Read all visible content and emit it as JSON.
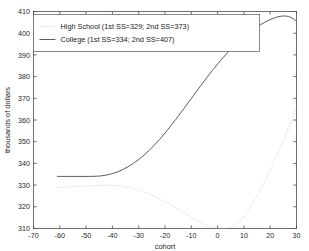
{
  "chart_data": {
    "type": "line",
    "title": "",
    "xlabel": "cohort",
    "ylabel": "thousands of dollars",
    "xlim": [
      -70,
      30
    ],
    "ylim": [
      310,
      410
    ],
    "xticks": [
      -70,
      -60,
      -50,
      -40,
      -30,
      -20,
      -10,
      0,
      10,
      20,
      30
    ],
    "xticklabels": [
      "-70",
      "-60",
      "-50",
      "-40",
      "-30",
      "-20",
      "-10",
      "0",
      "10",
      "20",
      "30"
    ],
    "yticks": [
      310,
      320,
      330,
      340,
      350,
      360,
      370,
      380,
      390,
      400,
      410
    ],
    "yticklabels": [
      "310",
      "320",
      "330",
      "340",
      "350",
      "360",
      "370",
      "380",
      "390",
      "400",
      "410"
    ],
    "grid": false,
    "legend_position": "upper-left",
    "legend_entries": [
      "High School (1st SS=329; 2nd SS=373)",
      "College (1st SS=334; 2nd SS=407)"
    ],
    "series": [
      {
        "name": "High School (1st SS=329; 2nd SS=373)",
        "style": "dotted",
        "color": "#c9c9c9",
        "x": [
          -61,
          -58,
          -55,
          -52,
          -49,
          -46,
          -43,
          -41,
          -39,
          -36,
          -33,
          -30,
          -27,
          -24,
          -21,
          -18,
          -15,
          -12,
          -9,
          -6,
          -3,
          0,
          2,
          3,
          5,
          7,
          9,
          11,
          13,
          15,
          17,
          19,
          21,
          23,
          25,
          27,
          29,
          30
        ],
        "y": [
          328.9,
          329.1,
          329.3,
          329.5,
          329.6,
          329.8,
          329.9,
          329.9,
          329.8,
          329.4,
          328.7,
          327.7,
          326.4,
          324.8,
          323.0,
          321.0,
          318.9,
          316.7,
          314.5,
          312.5,
          310.9,
          310.1,
          310.0,
          310.0,
          310.6,
          312.0,
          314.2,
          317.2,
          320.8,
          324.9,
          329.5,
          334.4,
          339.6,
          345.0,
          350.6,
          356.4,
          362.4,
          365.5
        ]
      },
      {
        "name": "College (1st SS=334; 2nd SS=407)",
        "style": "solid",
        "color": "#4a4a4a",
        "x": [
          -61,
          -57,
          -53,
          -49,
          -46,
          -44,
          -42,
          -40,
          -38,
          -36,
          -34,
          -32,
          -30,
          -28,
          -26,
          -24,
          -22,
          -20,
          -18,
          -16,
          -14,
          -12,
          -10,
          -8,
          -6,
          -4,
          -2,
          0,
          2,
          4,
          6,
          8,
          10,
          12,
          14,
          16,
          18,
          20,
          22,
          24,
          26,
          28,
          30
        ],
        "y": [
          334.0,
          334.0,
          334.0,
          334.0,
          334.1,
          334.3,
          334.7,
          335.3,
          336.1,
          337.2,
          338.5,
          340.0,
          341.8,
          343.8,
          346.0,
          348.5,
          351.1,
          354.0,
          357.0,
          360.1,
          363.3,
          366.6,
          369.9,
          373.2,
          376.5,
          379.7,
          382.8,
          385.8,
          388.6,
          391.3,
          393.8,
          396.1,
          398.3,
          400.3,
          402.1,
          403.7,
          405.1,
          406.3,
          407.2,
          407.8,
          407.9,
          407.2,
          405.5
        ]
      }
    ]
  },
  "colors": {
    "axis": "#4d4d4d",
    "solid_series": "#4a4a4a",
    "dotted_series": "#c9c9c9",
    "background": "#ffffff"
  }
}
